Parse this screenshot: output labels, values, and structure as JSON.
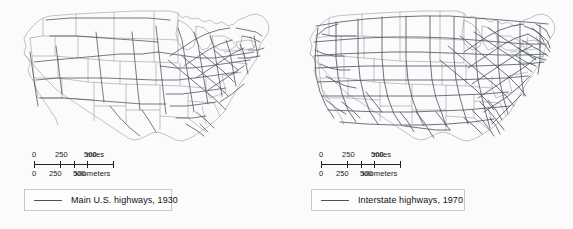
{
  "figure": {
    "type": "map-pair",
    "background": "#fbfbfb",
    "panel_count": 2
  },
  "style": {
    "state_border_color": "#9a9a9a",
    "coastline_color": "#8d8d8d",
    "highway_color": "#4a4f63",
    "legend_border_color": "#c9c9c9",
    "text_color": "#111111"
  },
  "panels": [
    {
      "id": "map-1930",
      "region": "United States",
      "legend": {
        "label": "Main U.S. highways, 1930",
        "swatch": "line-swatch"
      },
      "scale": {
        "miles": {
          "ticks": [
            "0",
            "250",
            "500"
          ],
          "unit": "miles"
        },
        "kilometers": {
          "ticks": [
            "0",
            "250",
            "500"
          ],
          "unit": "kilometers"
        }
      },
      "network_density": "sparse-west-dense-northeast"
    },
    {
      "id": "map-1970",
      "region": "United States",
      "legend": {
        "label": "Interstate highways, 1970",
        "swatch": "line-swatch"
      },
      "scale": {
        "miles": {
          "ticks": [
            "0",
            "250",
            "500"
          ],
          "unit": "miles"
        },
        "kilometers": {
          "ticks": [
            "0",
            "250",
            "500"
          ],
          "unit": "kilometers"
        }
      },
      "network_density": "nationwide-grid"
    }
  ]
}
